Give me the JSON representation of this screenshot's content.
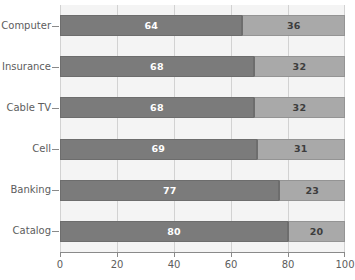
{
  "chart_data": {
    "type": "bar",
    "orientation": "horizontal",
    "stacked": true,
    "title": "",
    "subtitle": "",
    "xlabel": "",
    "ylabel": "",
    "xlim": [
      0,
      100
    ],
    "xticks": [
      0,
      20,
      40,
      60,
      80,
      100
    ],
    "xtick_labels": [
      "0",
      "20",
      "40",
      "60",
      "80",
      "100"
    ],
    "grid": "vertical",
    "legend": "none",
    "categories": [
      "Computer",
      "Insurance",
      "Cable TV",
      "Cell",
      "Banking",
      "Catalog"
    ],
    "series": [
      {
        "name": "primary",
        "color": "#7b7b7b",
        "values": [
          64,
          68,
          68,
          69,
          77,
          80
        ]
      },
      {
        "name": "secondary",
        "color": "#a9a9a9",
        "values": [
          36,
          32,
          32,
          31,
          23,
          20
        ]
      }
    ],
    "bar_labels": [
      {
        "category": "Computer",
        "primary": "64",
        "secondary": "36"
      },
      {
        "category": "Insurance",
        "primary": "68",
        "secondary": "32"
      },
      {
        "category": "Cable TV",
        "primary": "68",
        "secondary": "32"
      },
      {
        "category": "Cell",
        "primary": "69",
        "secondary": "31"
      },
      {
        "category": "Banking",
        "primary": "77",
        "secondary": "23"
      },
      {
        "category": "Catalog",
        "primary": "80",
        "secondary": "20"
      }
    ],
    "colors": {
      "primary_fill": "#7b7b7b",
      "secondary_fill": "#a9a9a9",
      "plot_background": "#f4f4f4",
      "gridline": "#d2d2d2",
      "axis": "#8a8a8a",
      "text": "#5d5d5d",
      "primary_label_text": "#ffffff",
      "secondary_label_text": "#3d3d3d"
    }
  }
}
